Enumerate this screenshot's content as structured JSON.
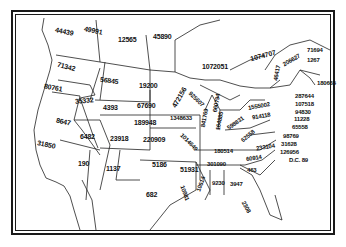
{
  "map": {
    "description": "Map of the United States and eastern Canada with numeric values labeled in each region",
    "regions": [
      {
        "id": "washington",
        "value": "71342"
      },
      {
        "id": "british-columbia",
        "value": "44439"
      },
      {
        "id": "alberta",
        "value": "49991"
      },
      {
        "id": "saskatchewan",
        "value": "12565"
      },
      {
        "id": "manitoba",
        "value": "45890"
      },
      {
        "id": "ontario",
        "value": "1072051"
      },
      {
        "id": "quebec",
        "value": "1074707"
      },
      {
        "id": "oregon",
        "value": "80761"
      },
      {
        "id": "idaho",
        "value": "35332"
      },
      {
        "id": "montana",
        "value": "56845"
      },
      {
        "id": "north-dakota",
        "value": "19200"
      },
      {
        "id": "minnesota",
        "value": "472156"
      },
      {
        "id": "wisconsin",
        "value": "925607"
      },
      {
        "id": "michigan",
        "value": "660794"
      },
      {
        "id": "new-york",
        "value": "1555002"
      },
      {
        "id": "vermont",
        "value": "206627"
      },
      {
        "id": "new-hampshire",
        "value": "46417"
      },
      {
        "id": "maine",
        "value": "71694"
      },
      {
        "id": "new-brunswick",
        "value": "1267"
      },
      {
        "id": "nova-scotia",
        "value": "180665"
      },
      {
        "id": "massachusetts",
        "value": "287644"
      },
      {
        "id": "rhode-island",
        "value": "107518"
      },
      {
        "id": "connecticut",
        "value": "94830"
      },
      {
        "id": "new-jersey",
        "value": "11228"
      },
      {
        "id": "delaware-area",
        "value": "65558"
      },
      {
        "id": "pennsylvania",
        "value": "914118"
      },
      {
        "id": "maryland",
        "value": "98769"
      },
      {
        "id": "delaware",
        "value": "31628"
      },
      {
        "id": "virginia-area",
        "value": "126956"
      },
      {
        "id": "dc",
        "value": "D.C. 89"
      },
      {
        "id": "wyoming",
        "value": "4393"
      },
      {
        "id": "south-dakota",
        "value": "67690"
      },
      {
        "id": "nebraska",
        "value": "189948"
      },
      {
        "id": "iowa",
        "value": "1348633"
      },
      {
        "id": "illinois",
        "value": "841769"
      },
      {
        "id": "indiana",
        "value": "164885"
      },
      {
        "id": "ohio",
        "value": "598831"
      },
      {
        "id": "west-virginia",
        "value": "62558"
      },
      {
        "id": "virginia",
        "value": "233104"
      },
      {
        "id": "nevada",
        "value": "8647"
      },
      {
        "id": "utah",
        "value": "6482"
      },
      {
        "id": "colorado",
        "value": "23918"
      },
      {
        "id": "kansas",
        "value": "220909"
      },
      {
        "id": "missouri",
        "value": "1014649"
      },
      {
        "id": "kentucky",
        "value": "180514"
      },
      {
        "id": "california",
        "value": "31850"
      },
      {
        "id": "arizona",
        "value": "190"
      },
      {
        "id": "new-mexico",
        "value": "1137"
      },
      {
        "id": "oklahoma",
        "value": "5186"
      },
      {
        "id": "arkansas",
        "value": "51931"
      },
      {
        "id": "tennessee",
        "value": "301090"
      },
      {
        "id": "north-carolina",
        "value": "60914"
      },
      {
        "id": "south-carolina",
        "value": "463"
      },
      {
        "id": "texas",
        "value": "682"
      },
      {
        "id": "louisiana",
        "value": "10981"
      },
      {
        "id": "mississippi",
        "value": "10614"
      },
      {
        "id": "alabama",
        "value": "9230"
      },
      {
        "id": "georgia",
        "value": "3947"
      },
      {
        "id": "florida",
        "value": "2308"
      }
    ]
  }
}
